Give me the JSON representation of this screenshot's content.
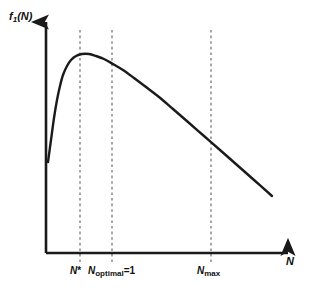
{
  "figure": {
    "background_color": "#ffffff",
    "line_color": "#1a1a1a",
    "axis_color": "#1a1a1a",
    "dash_color": "#777777",
    "y_axis_label_main": "f",
    "y_axis_label_sub": "1",
    "y_axis_label_arg": "(N)",
    "x_axis_label": "N"
  },
  "chart_data": {
    "type": "line",
    "title": "",
    "xlabel": "N",
    "ylabel": "f1(N)",
    "grid": false,
    "legend": null,
    "axis_arrows": true,
    "xlim": [
      0,
      1
    ],
    "ylim": [
      0,
      1
    ],
    "annotations": [
      {
        "id": "n-star",
        "label_parts": {
          "var": "N",
          "sup": "*"
        },
        "label": "N*",
        "x_px": 80,
        "description": "vertical dashed line at the curve maximum"
      },
      {
        "id": "n-optimal",
        "label_parts": {
          "var": "N",
          "sub": "optimal",
          "eq": "=1"
        },
        "label": "Noptimal=1",
        "x_px": 112,
        "description": "vertical dashed line right of the maximum"
      },
      {
        "id": "n-max",
        "label_parts": {
          "var": "N",
          "sub": "max"
        },
        "label": "Nmax",
        "x_px": 211,
        "description": "vertical dashed line on the descending branch"
      }
    ],
    "series": [
      {
        "name": "f1(N)",
        "style": "solid",
        "width": 2.4,
        "points_px": [
          [
            48,
            162
          ],
          [
            51,
            140
          ],
          [
            54,
            118
          ],
          [
            57,
            100
          ],
          [
            60,
            86
          ],
          [
            63,
            75
          ],
          [
            67,
            66
          ],
          [
            71,
            60
          ],
          [
            76,
            56
          ],
          [
            82,
            54
          ],
          [
            89,
            54
          ],
          [
            96,
            56
          ],
          [
            104,
            59
          ],
          [
            113,
            64
          ],
          [
            123,
            70
          ],
          [
            134,
            78
          ],
          [
            146,
            87
          ],
          [
            159,
            97
          ],
          [
            173,
            109
          ],
          [
            188,
            122
          ],
          [
            204,
            136
          ],
          [
            220,
            150
          ],
          [
            237,
            165
          ],
          [
            254,
            180
          ],
          [
            272,
            196
          ]
        ]
      }
    ],
    "axes_px": {
      "origin": [
        46,
        253
      ],
      "y_top": [
        46,
        18
      ],
      "x_right": [
        292,
        253
      ]
    },
    "dash_top_px": 30
  },
  "labels": {
    "tick_0": {
      "var": "N",
      "star": "*"
    },
    "tick_1": {
      "var": "N",
      "sub": "optimal",
      "eq": "=1"
    },
    "tick_2": {
      "var": "N",
      "sub": "max"
    }
  }
}
